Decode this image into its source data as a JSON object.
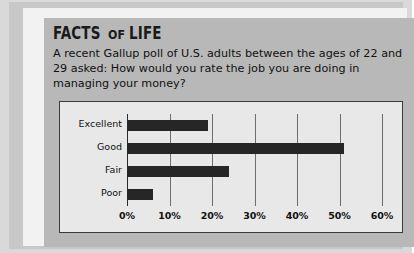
{
  "panel": {
    "title_parts": {
      "first": "FACTS",
      "middle": "OF",
      "last": "LIFE"
    },
    "blurb": "A recent Gallup poll of U.S. adults between the ages of 22 and 29 asked: How would you rate the job you are doing in managing your money?"
  },
  "colors": {
    "page_background": "#d9d9d9",
    "panel_background": "#b8b8b8",
    "frame_white": "#f2f2f2",
    "chart_background": "#e8e8e8",
    "bar": "#262626",
    "gridline": "#6e6e6e",
    "text": "#111111"
  },
  "chart_data": {
    "type": "bar",
    "orientation": "horizontal",
    "title": "",
    "xlabel": "",
    "ylabel": "",
    "categories": [
      "Excellent",
      "Good",
      "Fair",
      "Poor"
    ],
    "values": [
      19,
      51,
      24,
      6
    ],
    "xlim": [
      0,
      60
    ],
    "xticks": [
      0,
      10,
      20,
      30,
      40,
      50,
      60
    ],
    "xticklabels": [
      "0%",
      "10%",
      "20%",
      "30%",
      "40%",
      "50%",
      "60%"
    ],
    "grid": true,
    "grid_axis": "x",
    "legend": false
  }
}
